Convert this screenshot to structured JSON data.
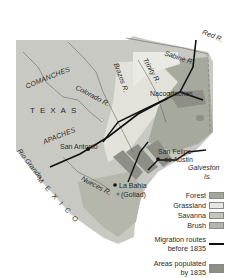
{
  "map": {
    "region": "Texas",
    "labels": {
      "red_river": "Red R.",
      "sabine_river": "Sabine R.",
      "trinity_river": "Trinity R.",
      "brazos_river": "Brazos R.",
      "colorado_river": "Colorado R.",
      "nueces_river": "Nueces R.",
      "rio_grande": "Rio Grande",
      "comanches": "COMANCHES",
      "apaches": "APACHES",
      "texas": "TEXAS",
      "mexico": "MEXICO",
      "nacogdoches": "Nacogdoches",
      "san_antonio": "San Antonio",
      "san_felipe_line1": "San Felipe",
      "san_felipe_line2": "de Austin",
      "la_bahia_line1": "La Bahia",
      "la_bahia_line2": "(Goliad)",
      "galveston_line1": "Galveston",
      "galveston_line2": "Is."
    },
    "colors": {
      "land": "#c9c9c3",
      "forest": "#a3a89a",
      "grassland": "#e6e6e0",
      "savanna": "#bdbfb5",
      "brush": "#b3b5ab",
      "populated": "#8d8f87",
      "water": "#ffffff",
      "route": "#111111"
    }
  },
  "legend": {
    "items": [
      {
        "label": "Forest",
        "color": "#a3a89a"
      },
      {
        "label": "Grassland",
        "color": "#e6e6e0"
      },
      {
        "label": "Savanna",
        "color": "#c3c5bb"
      },
      {
        "label": "Brush",
        "color": "#b3b5ab"
      }
    ],
    "migration_line1": "Migration routes",
    "migration_line2": "before 1835",
    "populated_line1": "Areas populated",
    "populated_line2": "by 1835",
    "populated_color": "#8d8f87"
  }
}
